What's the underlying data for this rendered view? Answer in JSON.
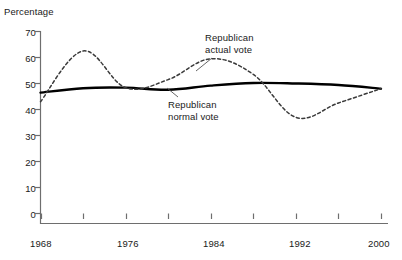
{
  "chart_data": {
    "type": "line",
    "title": "",
    "xlabel": "",
    "ylabel": "Percentage",
    "xlim": [
      1968,
      2000
    ],
    "ylim": [
      0,
      70
    ],
    "yticks": [
      0,
      10,
      20,
      30,
      40,
      50,
      60,
      70
    ],
    "xticks": [
      1968,
      1972,
      1976,
      1980,
      1984,
      1988,
      1992,
      1996,
      2000
    ],
    "xtick_labels_shown": [
      "1968",
      "1976",
      "1984",
      "1992",
      "2000"
    ],
    "grid": false,
    "legend_position": "inline-annotations",
    "x": [
      1968,
      1972,
      1976,
      1980,
      1984,
      1988,
      1992,
      1996,
      2000
    ],
    "series": [
      {
        "name": "Republican normal vote",
        "style": "solid",
        "color": "#000000",
        "values": [
          46.5,
          48.2,
          48.4,
          47.6,
          49.2,
          50.2,
          50.0,
          49.4,
          48.0
        ]
      },
      {
        "name": "Republican actual vote",
        "style": "dashed",
        "color": "#3a3a3a",
        "values": [
          43.0,
          62.5,
          48.4,
          51.5,
          59.5,
          53.5,
          37.0,
          42.5,
          48.0
        ]
      }
    ],
    "annotations": [
      {
        "text_line1": "Republican",
        "text_line2": "actual vote",
        "target_series": "Republican actual vote",
        "target_x": 1983
      },
      {
        "text_line1": "Republican",
        "text_line2": "normal vote",
        "target_series": "Republican normal vote",
        "target_x": 1979
      }
    ]
  },
  "yaxis": {
    "title": "Percentage",
    "labels": [
      "70",
      "60",
      "50",
      "40",
      "30",
      "20",
      "10",
      "0"
    ]
  },
  "xaxis": {
    "labels": [
      "1968",
      "1976",
      "1984",
      "1992",
      "2000"
    ]
  },
  "annotations": {
    "actual": {
      "line1": "Republican",
      "line2": "actual vote"
    },
    "normal": {
      "line1": "Republican",
      "line2": "normal vote"
    }
  },
  "colors": {
    "axis": "#6e6e6e",
    "solid_series": "#000000",
    "dashed_series": "#3a3a3a",
    "text": "#1a1a1a",
    "background": "#ffffff"
  }
}
